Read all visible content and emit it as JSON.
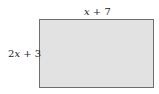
{
  "diagram": {
    "shape": "rectangle",
    "fill_color": "#e2e2e2",
    "border_color": "#6e6e6e",
    "top_label": {
      "var": "x",
      "rest": " + 7",
      "full": "x + 7"
    },
    "left_label": {
      "coef": "2",
      "var": "x",
      "rest": " + 3",
      "full": "2x + 3"
    }
  }
}
